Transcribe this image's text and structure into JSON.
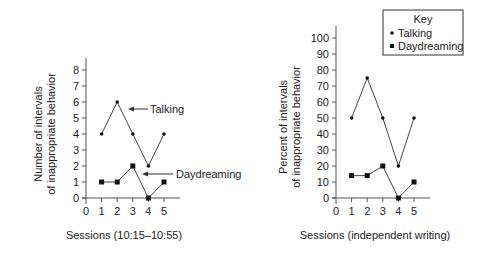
{
  "chart_data": [
    {
      "type": "line",
      "title": "",
      "xlabel": "Sessions (10:15–10:55)",
      "ylabel": "Number of intervals of inappropriate behavior",
      "ylabel_lines": [
        "Number of intervals",
        "of inappropriate behavior"
      ],
      "x": [
        1,
        2,
        3,
        4,
        5
      ],
      "x_ticks": [
        "0",
        "1",
        "2",
        "3",
        "4",
        "5"
      ],
      "y_ticks": [
        "0",
        "1",
        "2",
        "3",
        "4",
        "5",
        "6",
        "7",
        "8"
      ],
      "xlim": [
        0,
        5
      ],
      "ylim": [
        0,
        8
      ],
      "grid": false,
      "series": [
        {
          "name": "Talking",
          "marker": "circle",
          "values": [
            4,
            6,
            4,
            2,
            4
          ]
        },
        {
          "name": "Daydreaming",
          "marker": "square",
          "values": [
            1,
            1,
            2,
            0,
            1
          ]
        }
      ],
      "annotations": [
        "Talking",
        "Daydreaming"
      ]
    },
    {
      "type": "line",
      "title": "",
      "xlabel": "Sessions (independent writing)",
      "ylabel": "Percent of intervals of inappropriate behavior",
      "ylabel_lines": [
        "Percent of intervals",
        "of inappropriate behavior"
      ],
      "x": [
        1,
        2,
        3,
        4,
        5
      ],
      "x_ticks": [
        "0",
        "1",
        "2",
        "3",
        "4",
        "5"
      ],
      "y_ticks": [
        "0",
        "10",
        "20",
        "30",
        "40",
        "50",
        "60",
        "70",
        "80",
        "90",
        "100"
      ],
      "xlim": [
        0,
        5
      ],
      "ylim": [
        0,
        100
      ],
      "grid": false,
      "legend": {
        "title": "Key",
        "position": "upper right",
        "entries": [
          "Talking",
          "Daydreaming"
        ]
      },
      "series": [
        {
          "name": "Talking",
          "marker": "circle",
          "values": [
            50,
            75,
            50,
            20,
            50
          ]
        },
        {
          "name": "Daydreaming",
          "marker": "square",
          "values": [
            14,
            14,
            20,
            0,
            10
          ]
        }
      ]
    }
  ],
  "left_chart": {
    "ylabel_line1": "Number of intervals",
    "ylabel_line2": "of inappropriate behavior",
    "xlabel": "Sessions (10:15–10:55)",
    "annotation_talking": "Talking",
    "annotation_daydreaming": "Daydreaming"
  },
  "right_chart": {
    "ylabel_line1": "Percent of intervals",
    "ylabel_line2": "of inappropriate behavior",
    "xlabel": "Sessions (independent writing)",
    "legend_title": "Key",
    "legend_talking": "Talking",
    "legend_daydreaming": "Daydreaming"
  },
  "colors": {
    "line": "#444444",
    "marker": "#111111",
    "axis": "#555555",
    "text": "#222222"
  }
}
